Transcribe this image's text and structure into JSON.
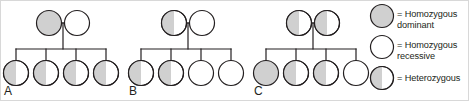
{
  "figure": {
    "background_color": "#ffffff",
    "border_color": "#d8d8d8",
    "stroke_color": "#231f20",
    "dominant_fill": "#d0d0d0",
    "recessive_fill": "#ffffff"
  },
  "genotype_keys": {
    "homozygous_dominant": "homozygous-dominant",
    "homozygous_recessive": "homozygous-recessive",
    "heterozygous": "heterozygous"
  },
  "panels": [
    {
      "id": "A",
      "label": "A",
      "label_x": 3,
      "label_y": 84,
      "parents": [
        {
          "name": "parent-1",
          "cx": 48,
          "cy": 22,
          "genotype": "homozygous-dominant"
        },
        {
          "name": "parent-2",
          "cx": 76,
          "cy": 22,
          "genotype": "homozygous-recessive"
        }
      ],
      "children": [
        {
          "name": "child-1",
          "cx": 15,
          "cy": 72,
          "genotype": "heterozygous"
        },
        {
          "name": "child-2",
          "cx": 45,
          "cy": 72,
          "genotype": "heterozygous"
        },
        {
          "name": "child-3",
          "cx": 75,
          "cy": 72,
          "genotype": "heterozygous"
        },
        {
          "name": "child-4",
          "cx": 105,
          "cy": 72,
          "genotype": "heterozygous"
        }
      ],
      "mating_y": 22,
      "descent_x": 62,
      "sibship_y": 48
    },
    {
      "id": "B",
      "label": "B",
      "label_x": 128,
      "label_y": 84,
      "parents": [
        {
          "name": "parent-1",
          "cx": 173,
          "cy": 22,
          "genotype": "heterozygous"
        },
        {
          "name": "parent-2",
          "cx": 201,
          "cy": 22,
          "genotype": "homozygous-recessive"
        }
      ],
      "children": [
        {
          "name": "child-1",
          "cx": 140,
          "cy": 72,
          "genotype": "heterozygous"
        },
        {
          "name": "child-2",
          "cx": 170,
          "cy": 72,
          "genotype": "heterozygous"
        },
        {
          "name": "child-3",
          "cx": 200,
          "cy": 72,
          "genotype": "homozygous-recessive"
        },
        {
          "name": "child-4",
          "cx": 230,
          "cy": 72,
          "genotype": "homozygous-recessive"
        }
      ],
      "mating_y": 22,
      "descent_x": 187,
      "sibship_y": 48
    },
    {
      "id": "C",
      "label": "C",
      "label_x": 253,
      "label_y": 84,
      "parents": [
        {
          "name": "parent-1",
          "cx": 298,
          "cy": 22,
          "genotype": "heterozygous"
        },
        {
          "name": "parent-2",
          "cx": 326,
          "cy": 22,
          "genotype": "heterozygous"
        }
      ],
      "children": [
        {
          "name": "child-1",
          "cx": 265,
          "cy": 72,
          "genotype": "homozygous-dominant"
        },
        {
          "name": "child-2",
          "cx": 295,
          "cy": 72,
          "genotype": "heterozygous"
        },
        {
          "name": "child-3",
          "cx": 325,
          "cy": 72,
          "genotype": "heterozygous"
        },
        {
          "name": "child-4",
          "cx": 355,
          "cy": 72,
          "genotype": "homozygous-recessive"
        }
      ],
      "mating_y": 22,
      "descent_x": 312,
      "sibship_y": 48
    }
  ],
  "legend": {
    "items": [
      {
        "name": "legend-homozygous-dominant",
        "genotype": "homozygous-dominant",
        "cx": 381,
        "cy": 15,
        "text": "= Homozygous\n   dominant",
        "text_x": 396,
        "text_y": 8
      },
      {
        "name": "legend-homozygous-recessive",
        "genotype": "homozygous-recessive",
        "cx": 381,
        "cy": 46,
        "text": "= Homozygous\n   recessive",
        "text_x": 396,
        "text_y": 39
      },
      {
        "name": "legend-heterozygous",
        "genotype": "heterozygous",
        "cx": 381,
        "cy": 77,
        "text": "= Heterozygous",
        "text_x": 396,
        "text_y": 72
      }
    ]
  },
  "geometry": {
    "symbol_radius": 12.5,
    "legend_symbol_radius": 11.5,
    "stroke_width": 1.2
  }
}
